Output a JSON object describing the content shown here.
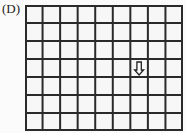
{
  "label": "(D)",
  "grid": {
    "columns": 9,
    "rows": 7,
    "line_color": "#2a2a2a",
    "cell_fill": "#f7f7f7"
  },
  "arrow": {
    "direction": "down",
    "column": 7,
    "row": 4,
    "icon": "down-arrow-icon"
  }
}
